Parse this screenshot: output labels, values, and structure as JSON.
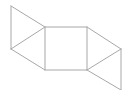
{
  "diagram": {
    "title": "",
    "line_color": "#a8a8a8",
    "background": "#ffffff",
    "faces": [
      {
        "name": "left-upper-triangle",
        "type": "triangle"
      },
      {
        "name": "left-lower-triangle",
        "type": "triangle"
      },
      {
        "name": "center-square",
        "type": "square"
      },
      {
        "name": "right-upper-triangle",
        "type": "triangle"
      },
      {
        "name": "right-lower-triangle",
        "type": "triangle"
      }
    ]
  }
}
